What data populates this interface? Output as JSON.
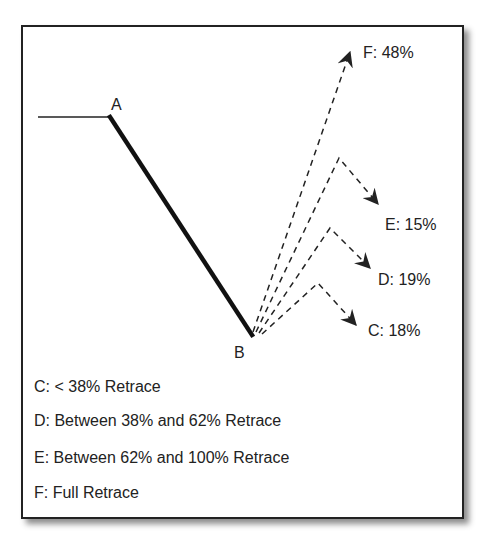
{
  "diagram": {
    "points": {
      "A": {
        "label": "A"
      },
      "B": {
        "label": "B"
      }
    },
    "outcomes": [
      {
        "id": "F",
        "label": "F: 48%"
      },
      {
        "id": "E",
        "label": "E: 15%"
      },
      {
        "id": "D",
        "label": "D: 19%"
      },
      {
        "id": "C",
        "label": "C: 18%"
      }
    ],
    "legend": [
      {
        "id": "C",
        "text": "C: < 38% Retrace"
      },
      {
        "id": "D",
        "text": "D: Between 38% and 62% Retrace"
      },
      {
        "id": "E",
        "text": "E: Between 62% and 100% Retrace"
      },
      {
        "id": "F",
        "text": "F: Full Retrace"
      }
    ],
    "colors": {
      "line": "#222222",
      "frame": "#222222",
      "background": "#ffffff"
    }
  }
}
